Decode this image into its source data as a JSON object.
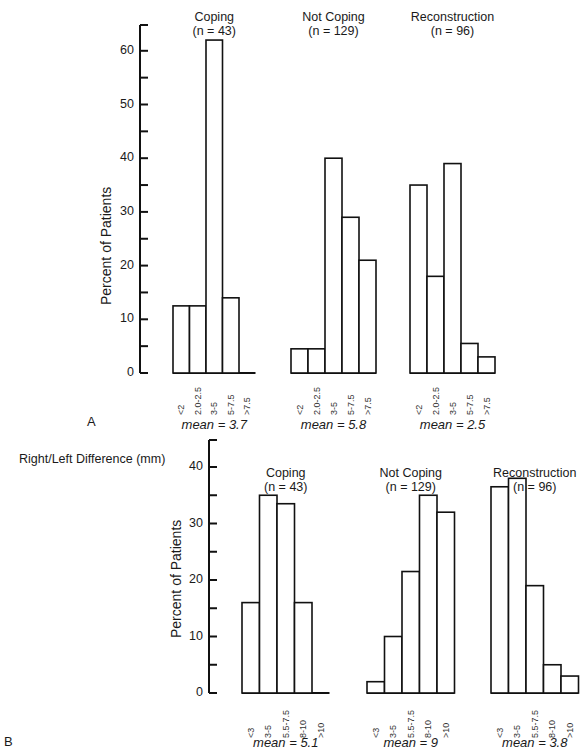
{
  "figure": {
    "panel_a_letter": "A",
    "panel_b_letter": "B",
    "side_title": "Right/Left Difference (mm)"
  },
  "chart_data": [
    {
      "type": "bar",
      "panel": "A",
      "ylabel": "Percent of Patients",
      "ylim": [
        0,
        65
      ],
      "yticks": [
        0,
        10,
        20,
        30,
        40,
        50,
        60
      ],
      "categories": [
        "<2",
        "2.0-2.5",
        "3-5",
        "5-7.5",
        ">7.5"
      ],
      "series": [
        {
          "name": "Coping",
          "n_label": "(n = 43)",
          "values": [
            12.5,
            12.5,
            62,
            14,
            0
          ],
          "mean_label": "mean = 3.7"
        },
        {
          "name": "Not Coping",
          "n_label": "(n = 129)",
          "values": [
            4.5,
            4.5,
            40,
            29,
            21
          ],
          "mean_label": "mean = 5.8"
        },
        {
          "name": "Reconstruction",
          "n_label": "(n = 96)",
          "values": [
            35,
            18,
            39,
            5.5,
            3
          ],
          "mean_label": "mean = 2.5"
        }
      ],
      "grid": false
    },
    {
      "type": "bar",
      "panel": "B",
      "title": "Right/Left Difference (mm)",
      "ylabel": "Percent of Patients",
      "ylim": [
        0,
        45
      ],
      "yticks": [
        0,
        10,
        20,
        30,
        40
      ],
      "categories": [
        "<3",
        "3-5",
        "5.5-7.5",
        "8-10",
        ">10"
      ],
      "series": [
        {
          "name": "Coping",
          "n_label": "(n = 43)",
          "values": [
            16,
            35,
            33.5,
            16,
            0
          ],
          "mean_label": "mean = 5.1"
        },
        {
          "name": "Not Coping",
          "n_label": "(n = 129)",
          "values": [
            2,
            10,
            21.5,
            35,
            32
          ],
          "mean_label": "mean = 9"
        },
        {
          "name": "Reconstruction",
          "n_label": "(n = 96)",
          "values": [
            36.5,
            38,
            19,
            5,
            3
          ],
          "mean_label": "mean = 3.8"
        }
      ],
      "grid": false
    }
  ]
}
